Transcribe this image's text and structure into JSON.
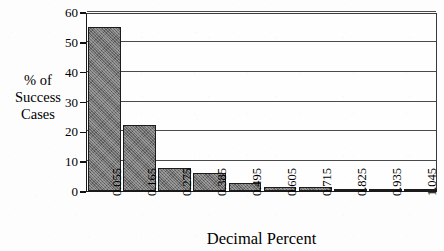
{
  "chart_data": {
    "type": "bar",
    "title": "",
    "xlabel": "Decimal Percent",
    "ylabel": "% of Success Cases",
    "ylabel_lines": [
      "% of",
      "Success",
      "Cases"
    ],
    "categories": [
      "0.055",
      "0.165",
      "0.275",
      "0.385",
      "0.495",
      "0.605",
      "0.715",
      "0.825",
      "0.935",
      "1.045"
    ],
    "values": [
      55,
      22,
      7.6,
      6.2,
      2.6,
      1.4,
      1.2,
      0.4,
      0.5,
      0.3
    ],
    "ylim": [
      0,
      60
    ],
    "yticks": [
      0,
      10,
      20,
      30,
      40,
      50,
      60
    ],
    "ytick_labels": [
      "0",
      "10",
      "20",
      "30",
      "40",
      "50",
      "60"
    ],
    "grid": "horizontal",
    "legend": "none",
    "bar_fill_color": "#6f6f6f",
    "bar_edge_color": "#1c1c1c",
    "axis_color": "#1a1a1a",
    "gridline_color": "#4a4a4a",
    "plot_background": "#fefefe"
  }
}
